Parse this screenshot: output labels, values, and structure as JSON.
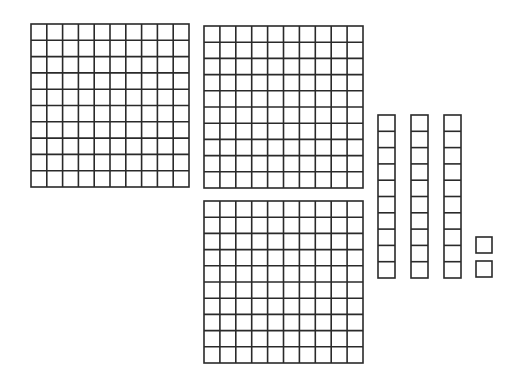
{
  "diagram": {
    "represented_value": 332,
    "line_color": "#2a2a2a",
    "fill_color": "#ffffff",
    "flats": [
      {
        "x": 30,
        "y": 23,
        "w": 158,
        "h": 163,
        "rows": 10,
        "cols": 10,
        "value": 100
      },
      {
        "x": 203,
        "y": 25,
        "w": 159,
        "h": 162,
        "rows": 10,
        "cols": 10,
        "value": 100
      },
      {
        "x": 203,
        "y": 200,
        "w": 159,
        "h": 162,
        "rows": 10,
        "cols": 10,
        "value": 100
      }
    ],
    "rods": [
      {
        "x": 377,
        "y": 114,
        "w": 17,
        "h": 163,
        "rows": 10,
        "value": 10
      },
      {
        "x": 410,
        "y": 114,
        "w": 17,
        "h": 163,
        "rows": 10,
        "value": 10
      },
      {
        "x": 443,
        "y": 114,
        "w": 17,
        "h": 163,
        "rows": 10,
        "value": 10
      }
    ],
    "units": [
      {
        "x": 475,
        "y": 236,
        "w": 16,
        "h": 16,
        "value": 1
      },
      {
        "x": 475,
        "y": 260,
        "w": 16,
        "h": 16,
        "value": 1
      }
    ]
  }
}
